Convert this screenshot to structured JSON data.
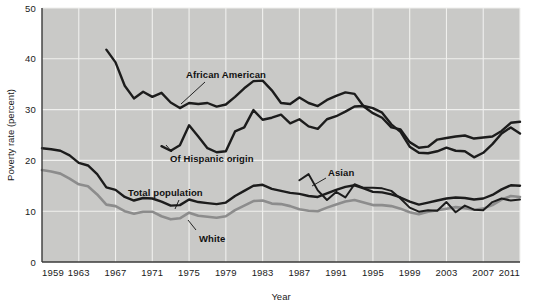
{
  "chart_data": {
    "type": "line",
    "title": "",
    "xlabel": "Year",
    "ylabel": "Poverty rate (percent)",
    "xlim": [
      1959,
      2011
    ],
    "ylim": [
      0,
      50
    ],
    "grid": true,
    "legend_position": "inline-annotations",
    "x_ticks": [
      "1959",
      "1963",
      "1967",
      "1971",
      "1975",
      "1979",
      "1983",
      "1987",
      "1991",
      "1995",
      "1999",
      "2003",
      "2007",
      "2011"
    ],
    "y_ticks": [
      "0",
      "10",
      "20",
      "30",
      "40",
      "50"
    ],
    "series": [
      {
        "name": "African American",
        "color": "#1c1c1c",
        "label": "African American",
        "x": [
          1966,
          1967,
          1968,
          1969,
          1970,
          1971,
          1972,
          1973,
          1974,
          1975,
          1976,
          1977,
          1978,
          1979,
          1980,
          1981,
          1982,
          1983,
          1984,
          1985,
          1986,
          1987,
          1988,
          1989,
          1990,
          1991,
          1992,
          1993,
          1994,
          1995,
          1996,
          1997,
          1998,
          1999,
          2000,
          2001,
          2002,
          2003,
          2004,
          2005,
          2006,
          2007,
          2008,
          2009,
          2010,
          2011
        ],
        "values": [
          41.8,
          39.3,
          34.7,
          32.2,
          33.5,
          32.5,
          33.3,
          31.4,
          30.3,
          31.3,
          31.1,
          31.3,
          30.6,
          31.0,
          32.5,
          34.2,
          35.6,
          35.7,
          33.8,
          31.3,
          31.1,
          32.4,
          31.3,
          30.7,
          31.9,
          32.7,
          33.4,
          33.1,
          30.6,
          29.3,
          28.4,
          26.5,
          26.1,
          23.6,
          22.5,
          22.7,
          24.1,
          24.4,
          24.7,
          24.9,
          24.3,
          24.5,
          24.7,
          25.8,
          27.4,
          27.6
        ]
      },
      {
        "name": "Of Hispanic origin",
        "color": "#1c1c1c",
        "label": "Of Hispanic origin",
        "x": [
          1972,
          1973,
          1974,
          1975,
          1976,
          1977,
          1978,
          1979,
          1980,
          1981,
          1982,
          1983,
          1984,
          1985,
          1986,
          1987,
          1988,
          1989,
          1990,
          1991,
          1992,
          1993,
          1994,
          1995,
          1996,
          1997,
          1998,
          1999,
          2000,
          2001,
          2002,
          2003,
          2004,
          2005,
          2006,
          2007,
          2008,
          2009,
          2010,
          2011
        ],
        "values": [
          22.8,
          21.9,
          23.0,
          26.9,
          24.7,
          22.4,
          21.6,
          21.8,
          25.7,
          26.5,
          29.9,
          28.0,
          28.4,
          29.0,
          27.3,
          28.1,
          26.7,
          26.2,
          28.1,
          28.7,
          29.6,
          30.6,
          30.7,
          30.3,
          29.4,
          27.1,
          25.6,
          22.7,
          21.5,
          21.4,
          21.8,
          22.5,
          21.9,
          21.8,
          20.6,
          21.5,
          23.2,
          25.3,
          26.5,
          25.3
        ]
      },
      {
        "name": "Total population",
        "color": "#1c1c1c",
        "label": "Total population",
        "x": [
          1959,
          1960,
          1961,
          1962,
          1963,
          1964,
          1965,
          1966,
          1967,
          1968,
          1969,
          1970,
          1971,
          1972,
          1973,
          1974,
          1975,
          1976,
          1977,
          1978,
          1979,
          1980,
          1981,
          1982,
          1983,
          1984,
          1985,
          1986,
          1987,
          1988,
          1989,
          1990,
          1991,
          1992,
          1993,
          1994,
          1995,
          1996,
          1997,
          1998,
          1999,
          2000,
          2001,
          2002,
          2003,
          2004,
          2005,
          2006,
          2007,
          2008,
          2009,
          2010,
          2011
        ],
        "values": [
          22.4,
          22.2,
          21.9,
          21.0,
          19.5,
          19.0,
          17.3,
          14.7,
          14.2,
          12.8,
          12.1,
          12.6,
          12.5,
          11.9,
          11.1,
          11.2,
          12.3,
          11.8,
          11.6,
          11.4,
          11.7,
          13.0,
          14.0,
          15.0,
          15.2,
          14.4,
          14.0,
          13.6,
          13.4,
          13.0,
          12.8,
          13.5,
          14.2,
          14.8,
          15.1,
          14.5,
          13.8,
          13.7,
          13.3,
          12.7,
          11.9,
          11.3,
          11.7,
          12.1,
          12.5,
          12.7,
          12.6,
          12.3,
          12.5,
          13.2,
          14.3,
          15.1,
          15.0
        ]
      },
      {
        "name": "White",
        "color": "#8c8c8c",
        "label": "White",
        "x": [
          1959,
          1960,
          1961,
          1962,
          1963,
          1964,
          1965,
          1966,
          1967,
          1968,
          1969,
          1970,
          1971,
          1972,
          1973,
          1974,
          1975,
          1976,
          1977,
          1978,
          1979,
          1980,
          1981,
          1982,
          1983,
          1984,
          1985,
          1986,
          1987,
          1988,
          1989,
          1990,
          1991,
          1992,
          1993,
          1994,
          1995,
          1996,
          1997,
          1998,
          1999,
          2000,
          2001,
          2002,
          2003,
          2004,
          2005,
          2006,
          2007,
          2008,
          2009,
          2010,
          2011
        ],
        "values": [
          18.1,
          17.8,
          17.4,
          16.4,
          15.3,
          14.9,
          13.3,
          11.3,
          11.0,
          10.0,
          9.5,
          9.9,
          9.9,
          9.0,
          8.4,
          8.6,
          9.7,
          9.1,
          8.9,
          8.7,
          9.0,
          10.2,
          11.1,
          12.0,
          12.1,
          11.5,
          11.4,
          11.0,
          10.4,
          10.1,
          10.0,
          10.7,
          11.3,
          11.9,
          12.2,
          11.7,
          11.2,
          11.2,
          11.0,
          10.5,
          9.8,
          9.4,
          9.9,
          10.2,
          10.5,
          10.8,
          10.6,
          10.3,
          10.5,
          11.2,
          12.3,
          13.0,
          12.8
        ]
      },
      {
        "name": "Asian",
        "color": "#1c1c1c",
        "label": "Asian",
        "x": [
          1987,
          1988,
          1989,
          1990,
          1991,
          1992,
          1993,
          1994,
          1995,
          1996,
          1997,
          1998,
          1999,
          2000,
          2001,
          2002,
          2003,
          2004,
          2005,
          2006,
          2007,
          2008,
          2009,
          2010,
          2011
        ],
        "values": [
          16.1,
          17.3,
          14.1,
          12.2,
          13.8,
          12.7,
          15.3,
          14.6,
          14.6,
          14.5,
          14.0,
          12.5,
          10.7,
          9.9,
          10.2,
          10.1,
          11.8,
          9.8,
          11.1,
          10.3,
          10.2,
          11.8,
          12.5,
          12.1,
          12.3
        ]
      }
    ]
  },
  "annotations": {
    "african_american": "African American",
    "hispanic": "Of Hispanic origin",
    "total_population": "Total population",
    "white": "White",
    "asian": "Asian"
  },
  "axes": {
    "y_title": "Poverty rate (percent)",
    "x_title": "Year",
    "y_tick_0": "0",
    "y_tick_10": "10",
    "y_tick_20": "20",
    "y_tick_30": "30",
    "y_tick_40": "40",
    "y_tick_50": "50",
    "x_tick_1959": "1959",
    "x_tick_1963": "1963",
    "x_tick_1967": "1967",
    "x_tick_1971": "1971",
    "x_tick_1975": "1975",
    "x_tick_1979": "1979",
    "x_tick_1983": "1983",
    "x_tick_1987": "1987",
    "x_tick_1991": "1991",
    "x_tick_1995": "1995",
    "x_tick_1999": "1999",
    "x_tick_2003": "2003",
    "x_tick_2007": "2007",
    "x_tick_2011": "2011"
  },
  "colors": {
    "plot_background": "#c9c9c7",
    "grid": "#f0f0ee",
    "axis": "#3a3a3a",
    "dark_series": "#1c1c1c",
    "light_series": "#8c8c8c",
    "page_background": "#ffffff"
  }
}
